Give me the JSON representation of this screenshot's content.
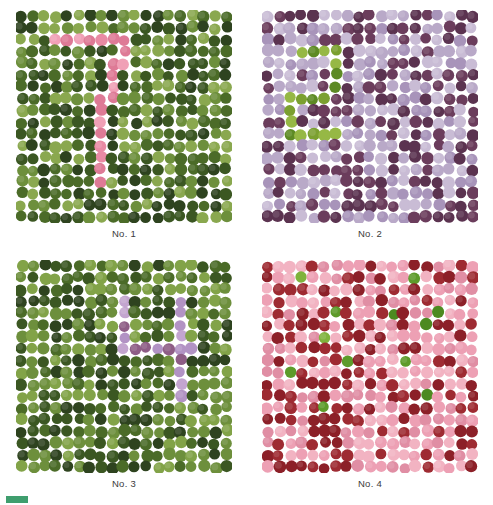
{
  "page": {
    "width": 493,
    "height": 505,
    "background": "#ffffff",
    "kind": "color-vision-test-plates"
  },
  "footer": {
    "swatch_color": "#3f9e6e",
    "text": ""
  },
  "plates": [
    {
      "id": "plate-1",
      "label": "No. 1",
      "hidden_figure": "7",
      "x": 16,
      "y": 10,
      "width": 216,
      "height": 213,
      "label_y": 228,
      "cols": 19,
      "rows": 18,
      "dot_radius": 5.9,
      "jitter": 1.5,
      "background_colors": [
        "#2e431f",
        "#4b6b28",
        "#6d8f3c",
        "#8aa84f",
        "#3b5722"
      ],
      "figure_colors": [
        "#e98aa4",
        "#de7a96",
        "#f0a0b6"
      ],
      "figure_cells": [
        [
          2,
          3
        ],
        [
          2,
          4
        ],
        [
          2,
          5
        ],
        [
          2,
          6
        ],
        [
          2,
          7
        ],
        [
          2,
          8
        ],
        [
          2,
          9
        ],
        [
          3,
          9
        ],
        [
          4,
          9
        ],
        [
          4,
          8
        ],
        [
          5,
          8
        ],
        [
          6,
          8
        ],
        [
          7,
          8
        ],
        [
          7,
          7
        ],
        [
          8,
          7
        ],
        [
          9,
          7
        ],
        [
          10,
          7
        ],
        [
          11,
          7
        ],
        [
          12,
          7
        ],
        [
          13,
          7
        ],
        [
          14,
          7
        ]
      ]
    },
    {
      "id": "plate-2",
      "label": "No. 2",
      "hidden_figure": "2",
      "x": 262,
      "y": 10,
      "width": 216,
      "height": 213,
      "label_y": 228,
      "cols": 19,
      "rows": 18,
      "dot_radius": 5.9,
      "jitter": 1.5,
      "background_colors": [
        "#6b3d5c",
        "#5b3350",
        "#b9a9c8",
        "#a894ba",
        "#c9bcd5"
      ],
      "figure_colors": [
        "#7ba030",
        "#5d8a24",
        "#96b845"
      ],
      "figure_cells": [
        [
          3,
          3
        ],
        [
          3,
          4
        ],
        [
          3,
          5
        ],
        [
          3,
          6
        ],
        [
          4,
          6
        ],
        [
          5,
          6
        ],
        [
          6,
          6
        ],
        [
          7,
          5
        ],
        [
          7,
          4
        ],
        [
          7,
          3
        ],
        [
          7,
          2
        ],
        [
          8,
          2
        ],
        [
          9,
          2
        ],
        [
          10,
          2
        ],
        [
          10,
          3
        ],
        [
          10,
          4
        ],
        [
          10,
          5
        ],
        [
          10,
          6
        ]
      ]
    },
    {
      "id": "plate-3",
      "label": "No. 3",
      "hidden_figure": "4",
      "x": 16,
      "y": 260,
      "width": 216,
      "height": 213,
      "label_y": 478,
      "cols": 19,
      "rows": 18,
      "dot_radius": 5.9,
      "jitter": 1.5,
      "background_colors": [
        "#4b6b28",
        "#3b5722",
        "#6d8f3c",
        "#82a348",
        "#2e431f"
      ],
      "figure_colors": [
        "#c3a5cf",
        "#8e5d86",
        "#b293c4"
      ],
      "figure_cells": [
        [
          3,
          9
        ],
        [
          4,
          9
        ],
        [
          5,
          9
        ],
        [
          6,
          9
        ],
        [
          3,
          14
        ],
        [
          4,
          14
        ],
        [
          5,
          14
        ],
        [
          6,
          14
        ],
        [
          7,
          9
        ],
        [
          7,
          10
        ],
        [
          7,
          11
        ],
        [
          7,
          12
        ],
        [
          7,
          13
        ],
        [
          7,
          14
        ],
        [
          7,
          15
        ],
        [
          8,
          14
        ],
        [
          9,
          14
        ],
        [
          10,
          14
        ],
        [
          11,
          14
        ]
      ]
    },
    {
      "id": "plate-4",
      "label": "No. 4",
      "hidden_figure": "none",
      "x": 262,
      "y": 260,
      "width": 216,
      "height": 213,
      "label_y": 478,
      "cols": 19,
      "rows": 18,
      "dot_radius": 5.9,
      "jitter": 1.5,
      "background_colors": [
        "#9e2b32",
        "#8c2028",
        "#eda0b4",
        "#e08ea4",
        "#f2b3c2"
      ],
      "figure_colors": [
        "#5d9b2a",
        "#4d8a20",
        "#7fb33c"
      ],
      "figure_cells": [
        [
          1,
          3
        ],
        [
          1,
          13
        ],
        [
          4,
          6
        ],
        [
          4,
          11
        ],
        [
          4,
          15
        ],
        [
          5,
          14
        ],
        [
          6,
          5
        ],
        [
          8,
          7
        ],
        [
          8,
          12
        ],
        [
          9,
          2
        ],
        [
          11,
          14
        ],
        [
          12,
          5
        ]
      ]
    }
  ]
}
